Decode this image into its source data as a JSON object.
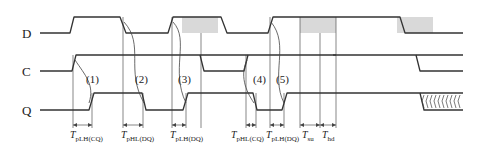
{
  "diagram": {
    "type": "timing-diagram",
    "signals": [
      {
        "id": "D",
        "label": "D"
      },
      {
        "id": "C",
        "label": "C"
      },
      {
        "id": "Q",
        "label": "Q"
      }
    ],
    "events": [
      {
        "label": "(1)"
      },
      {
        "label": "(2)"
      },
      {
        "label": "(3)"
      },
      {
        "label": "(4)"
      },
      {
        "label": "(5)"
      }
    ],
    "timing_labels": [
      {
        "main": "T",
        "sub": "pLH(CQ)"
      },
      {
        "main": "T",
        "sub": "pHL(DQ)"
      },
      {
        "main": "T",
        "sub": "pLH(DQ)"
      },
      {
        "main": "T",
        "sub": "pHL(CQ)"
      },
      {
        "main": "T",
        "sub": "pLH(DQ)"
      },
      {
        "main": "T",
        "sub": "su"
      },
      {
        "main": "T",
        "sub": "hd"
      }
    ],
    "colors": {
      "signal": "#333333",
      "shade": "#d9d9d9"
    }
  }
}
